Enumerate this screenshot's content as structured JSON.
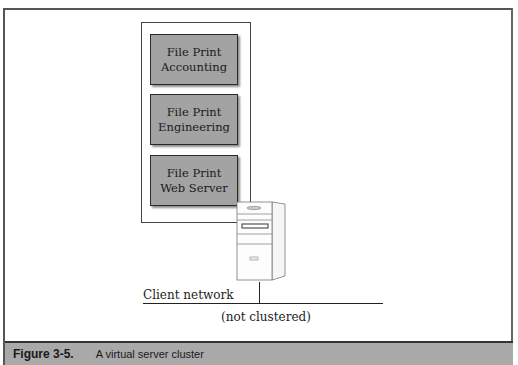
{
  "figure": {
    "number": "Figure 3-5.",
    "title": "A virtual server cluster"
  },
  "virtual_servers": [
    {
      "line1": "File Print",
      "line2": "Accounting"
    },
    {
      "line1": "File Print",
      "line2": "Engineering"
    },
    {
      "line1": "File Print",
      "line2": "Web Server"
    }
  ],
  "network": {
    "label": "Client network",
    "note": "(not clustered)"
  },
  "colors": {
    "server_box_fill": "#a3a3a3",
    "caption_band": "#a9a9a9"
  }
}
